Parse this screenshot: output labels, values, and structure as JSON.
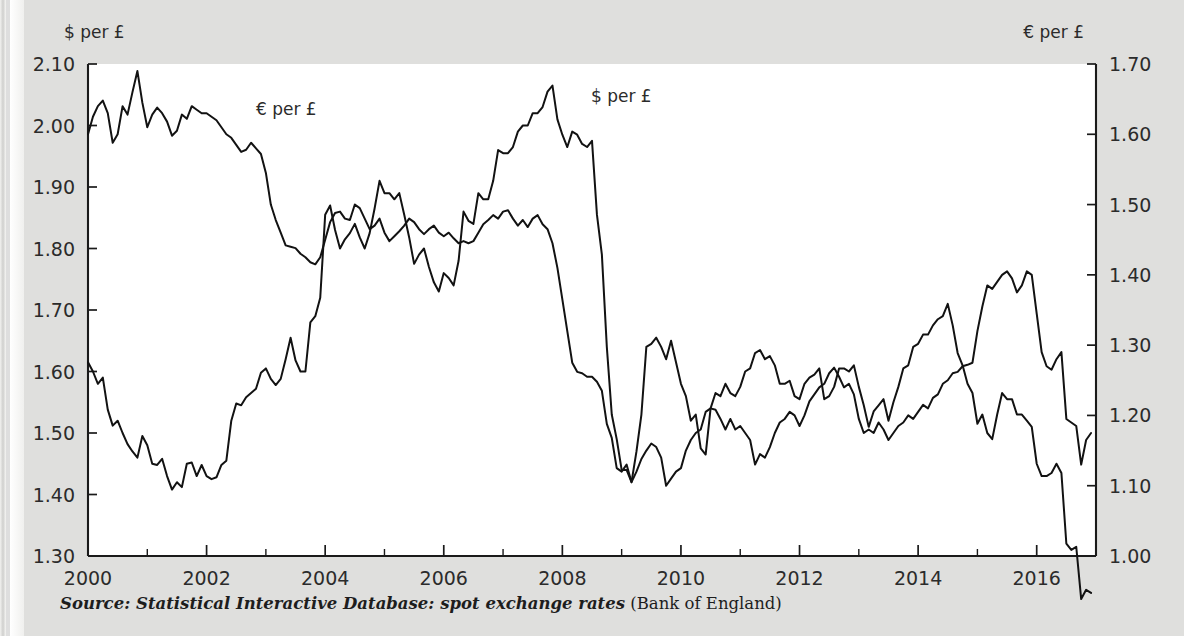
{
  "figure": {
    "left_axis_title": "$ per £",
    "right_axis_title": "€ per £",
    "series_label_eur": "€ per £",
    "series_label_usd": "$ per £",
    "source_italic": "Source: Statistical Interactive Database: spot exchange rates",
    "source_roman": " (Bank of England)",
    "ghost_text": "",
    "ink_color": "#121212",
    "page_color": "#dfdfdd",
    "plot_color": "#ffffff"
  },
  "chart_data": {
    "type": "line",
    "title": "",
    "subtitle": "",
    "xlabel": "",
    "ylabel": "$ per £",
    "ylabel_right": "€ per £",
    "grid": false,
    "legend": "inline-annotations",
    "xlim": [
      2000.0,
      2017.0
    ],
    "ylim": [
      1.3,
      2.1
    ],
    "ylim_right": [
      1.0,
      1.7
    ],
    "xticks": [
      2000,
      2002,
      2004,
      2006,
      2008,
      2010,
      2012,
      2014,
      2016
    ],
    "xticks_minor": [
      2001,
      2003,
      2005,
      2007,
      2009,
      2011,
      2013,
      2015
    ],
    "yticks_left": [
      "1.30",
      "1.40",
      "1.50",
      "1.60",
      "1.70",
      "1.80",
      "1.90",
      "2.00",
      "2.10"
    ],
    "yticks_right": [
      "1.00",
      "1.10",
      "1.20",
      "1.30",
      "1.40",
      "1.50",
      "1.60",
      "1.70"
    ],
    "x_start": 2000.0,
    "x_step": 0.08333333,
    "series": [
      {
        "name": "$ per £",
        "axis": "left",
        "units": "US dollars per pound sterling",
        "values": [
          1.615,
          1.6,
          1.58,
          1.59,
          1.538,
          1.512,
          1.52,
          1.5,
          1.482,
          1.47,
          1.46,
          1.495,
          1.48,
          1.45,
          1.448,
          1.458,
          1.43,
          1.408,
          1.42,
          1.412,
          1.45,
          1.452,
          1.43,
          1.448,
          1.43,
          1.425,
          1.428,
          1.448,
          1.455,
          1.52,
          1.548,
          1.545,
          1.558,
          1.565,
          1.572,
          1.598,
          1.605,
          1.588,
          1.578,
          1.588,
          1.62,
          1.655,
          1.618,
          1.6,
          1.6,
          1.68,
          1.69,
          1.72,
          1.855,
          1.87,
          1.83,
          1.8,
          1.815,
          1.825,
          1.84,
          1.818,
          1.8,
          1.825,
          1.865,
          1.91,
          1.89,
          1.89,
          1.88,
          1.89,
          1.855,
          1.818,
          1.775,
          1.79,
          1.8,
          1.77,
          1.745,
          1.73,
          1.76,
          1.752,
          1.74,
          1.78,
          1.86,
          1.845,
          1.84,
          1.89,
          1.88,
          1.88,
          1.91,
          1.96,
          1.955,
          1.955,
          1.965,
          1.99,
          2.0,
          2.0,
          2.02,
          2.02,
          2.03,
          2.055,
          2.065,
          2.01,
          1.985,
          1.965,
          1.99,
          1.985,
          1.97,
          1.965,
          1.975,
          1.855,
          1.79,
          1.64,
          1.53,
          1.49,
          1.44,
          1.44,
          1.42,
          1.47,
          1.53,
          1.64,
          1.645,
          1.655,
          1.64,
          1.62,
          1.65,
          1.615,
          1.58,
          1.56,
          1.52,
          1.53,
          1.475,
          1.465,
          1.54,
          1.565,
          1.56,
          1.58,
          1.565,
          1.56,
          1.575,
          1.6,
          1.605,
          1.63,
          1.635,
          1.62,
          1.625,
          1.61,
          1.58,
          1.58,
          1.585,
          1.56,
          1.555,
          1.58,
          1.59,
          1.595,
          1.605,
          1.555,
          1.56,
          1.575,
          1.605,
          1.605,
          1.6,
          1.61,
          1.575,
          1.545,
          1.51,
          1.535,
          1.545,
          1.555,
          1.52,
          1.55,
          1.575,
          1.605,
          1.61,
          1.64,
          1.645,
          1.66,
          1.66,
          1.675,
          1.685,
          1.69,
          1.71,
          1.675,
          1.63,
          1.61,
          1.58,
          1.565,
          1.515,
          1.53,
          1.5,
          1.49,
          1.53,
          1.565,
          1.555,
          1.555,
          1.53,
          1.53,
          1.52,
          1.51,
          1.45,
          1.43,
          1.43,
          1.435,
          1.45,
          1.435,
          1.32,
          1.31,
          1.315,
          1.23,
          1.245,
          1.24
        ]
      },
      {
        "name": "€ per £",
        "axis": "right",
        "units": "euros per pound sterling",
        "values": [
          1.6,
          1.625,
          1.64,
          1.648,
          1.63,
          1.588,
          1.6,
          1.64,
          1.628,
          1.66,
          1.69,
          1.645,
          1.61,
          1.628,
          1.638,
          1.63,
          1.618,
          1.598,
          1.605,
          1.628,
          1.622,
          1.64,
          1.635,
          1.63,
          1.63,
          1.625,
          1.62,
          1.61,
          1.6,
          1.595,
          1.585,
          1.575,
          1.578,
          1.588,
          1.58,
          1.572,
          1.545,
          1.5,
          1.478,
          1.46,
          1.442,
          1.44,
          1.438,
          1.43,
          1.425,
          1.418,
          1.415,
          1.425,
          1.45,
          1.475,
          1.488,
          1.49,
          1.48,
          1.478,
          1.5,
          1.495,
          1.48,
          1.465,
          1.47,
          1.48,
          1.46,
          1.448,
          1.455,
          1.462,
          1.47,
          1.48,
          1.475,
          1.465,
          1.458,
          1.465,
          1.47,
          1.46,
          1.455,
          1.46,
          1.452,
          1.445,
          1.448,
          1.445,
          1.448,
          1.46,
          1.472,
          1.478,
          1.485,
          1.48,
          1.49,
          1.492,
          1.48,
          1.47,
          1.478,
          1.468,
          1.48,
          1.485,
          1.472,
          1.465,
          1.445,
          1.41,
          1.365,
          1.32,
          1.275,
          1.262,
          1.26,
          1.255,
          1.255,
          1.248,
          1.235,
          1.188,
          1.168,
          1.125,
          1.12,
          1.13,
          1.105,
          1.12,
          1.138,
          1.15,
          1.16,
          1.155,
          1.14,
          1.1,
          1.11,
          1.12,
          1.125,
          1.15,
          1.165,
          1.175,
          1.18,
          1.205,
          1.21,
          1.208,
          1.195,
          1.18,
          1.195,
          1.18,
          1.185,
          1.175,
          1.165,
          1.13,
          1.145,
          1.14,
          1.155,
          1.175,
          1.19,
          1.195,
          1.205,
          1.2,
          1.185,
          1.2,
          1.22,
          1.23,
          1.24,
          1.245,
          1.26,
          1.268,
          1.255,
          1.24,
          1.245,
          1.23,
          1.195,
          1.175,
          1.18,
          1.175,
          1.19,
          1.18,
          1.165,
          1.175,
          1.185,
          1.19,
          1.2,
          1.195,
          1.205,
          1.215,
          1.21,
          1.225,
          1.23,
          1.245,
          1.25,
          1.26,
          1.262,
          1.27,
          1.272,
          1.275,
          1.32,
          1.355,
          1.385,
          1.38,
          1.39,
          1.4,
          1.405,
          1.395,
          1.375,
          1.385,
          1.405,
          1.4,
          1.345,
          1.29,
          1.27,
          1.265,
          1.28,
          1.29,
          1.195,
          1.19,
          1.185,
          1.13,
          1.165,
          1.175
        ]
      }
    ]
  }
}
